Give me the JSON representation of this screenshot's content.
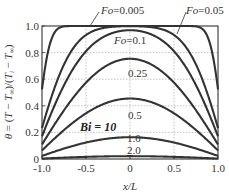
{
  "chart_data": {
    "type": "line",
    "title": "",
    "xlabel": "x/L",
    "ylabel": "θ = (T − T∞)/(Ti − T∞)",
    "xlim": [
      -1.0,
      1.0
    ],
    "ylim": [
      0,
      1.0
    ],
    "grid": true,
    "x_ticks": [
      "-1.0",
      "-0.5",
      "0",
      "0.5",
      "1.0"
    ],
    "x_tick_values": [
      -1.0,
      -0.5,
      0,
      0.5,
      1.0
    ],
    "y_ticks": [
      "0",
      "0.2",
      "0.4",
      "0.6",
      "0.8",
      "1.0"
    ],
    "y_tick_values": [
      0,
      0.2,
      0.4,
      0.6,
      0.8,
      1.0
    ],
    "annotation": "Bi = 10",
    "parameter": {
      "name": "Fo",
      "Bi": 10
    },
    "series": [
      {
        "name": "Fo=0.005",
        "label": "Fo=0.005",
        "Fo": 0.005,
        "peak": 1.0
      },
      {
        "name": "Fo=0.05",
        "label": "Fo=0.05",
        "Fo": 0.05,
        "peak": 1.0
      },
      {
        "name": "Fo=0.1",
        "label": "Fo=0.1",
        "Fo": 0.1,
        "peak": 0.97
      },
      {
        "name": "Fo=0.25",
        "label": "0.25",
        "Fo": 0.25,
        "peak": 0.76
      },
      {
        "name": "Fo=0.5",
        "label": "0.5",
        "Fo": 0.5,
        "peak": 0.45
      },
      {
        "name": "Fo=1.0",
        "label": "1.0",
        "Fo": 1.0,
        "peak": 0.17
      },
      {
        "name": "Fo=2.0",
        "label": "2.0",
        "Fo": 2.0,
        "peak": 0.02
      }
    ]
  }
}
